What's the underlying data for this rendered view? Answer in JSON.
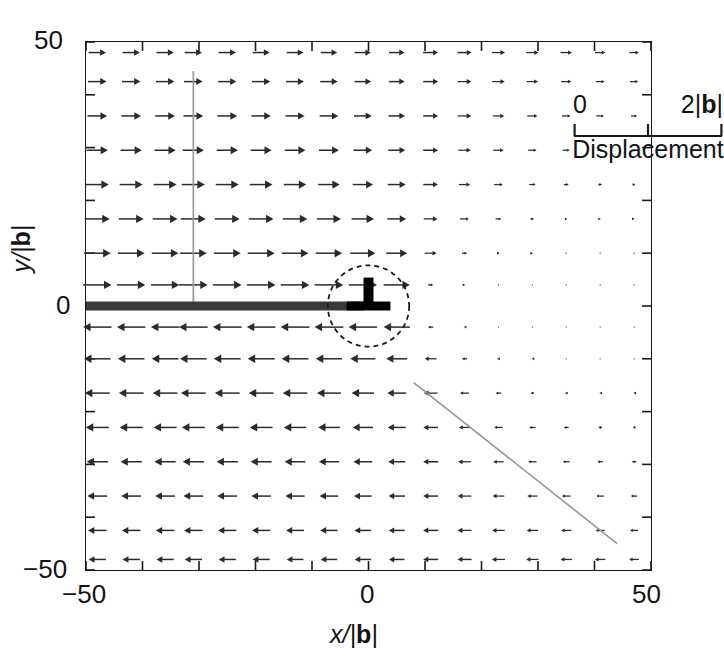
{
  "figure": {
    "kind": "vector-field-quiver"
  },
  "axes": {
    "x": {
      "title": "x/|b|",
      "title_var": "x",
      "title_sep": "/|",
      "title_vec": "b",
      "title_close": "|",
      "ticks": [
        -50,
        0,
        50
      ],
      "tick_labels": [
        "−50",
        "0",
        "50"
      ],
      "minor_tick_step": 10,
      "range": [
        -50,
        50
      ]
    },
    "y": {
      "title": "y/|b|",
      "title_var": "y",
      "title_sep": "/|",
      "title_vec": "b",
      "title_close": "|",
      "ticks": [
        50,
        0,
        -50
      ],
      "tick_labels": [
        "50",
        "0",
        "−50"
      ],
      "minor_tick_step": 10,
      "range": [
        -50,
        50
      ]
    },
    "frame_color": "#1a1a1a"
  },
  "legend": {
    "name": "displacement-scale-bar",
    "min_label": "0",
    "max_label_number": "2",
    "max_label_vector": "b",
    "max_label": "2|b|",
    "caption": "Displacement",
    "tick_count": 3,
    "bar_color": "#1a1a1a"
  },
  "annotations": {
    "dislocation_symbol": {
      "name": "edge-dislocation-symbol",
      "glyph": "⊥",
      "x": 0,
      "y": 0,
      "color": "#000000"
    },
    "core_circle": {
      "name": "dislocation-core-circle",
      "x": 0,
      "y": 0,
      "radius_units": 7.2,
      "style": "dashed",
      "color": "#1a1a1a"
    },
    "slip_plane": {
      "name": "slip-plane-line",
      "x_start": -50,
      "x_end": -0.8,
      "y": 0,
      "color": "#3a3a3a",
      "thickness_px": 9
    },
    "guide_vertical": {
      "name": "guide-line-vertical",
      "x": -31,
      "y_top": 44.5,
      "y_bottom": 0,
      "color": "#9a9a9a"
    },
    "guide_diagonal": {
      "name": "guide-line-diagonal",
      "x_start": 8,
      "y_start": -14.5,
      "x_end": 44,
      "y_end": -45,
      "color": "#9a9a9a"
    }
  },
  "chart_data": {
    "type": "scatter",
    "subtype": "quiver",
    "title": "",
    "xlabel": "x/|b|",
    "ylabel": "y/|b|",
    "xlim": [
      -50,
      50
    ],
    "ylim": [
      -50,
      50
    ],
    "grid": false,
    "legend_position": "top-right",
    "scale": {
      "arrow_full_length_units": 2,
      "arrow_full_length_label": "2|b|",
      "zero_label": "0"
    },
    "notes": [
      "Arrows above the slip plane (y>0) point in +x direction.",
      "Arrows below the slip plane (y<0) point in -x direction.",
      "Arrow magnitude decays with distance from the dislocation core at (0,0).",
      "On the x>0 side near y=0 the displacement magnitude collapses to nearly zero."
    ],
    "grid_x": [
      -48,
      -42,
      -36,
      -31,
      -25,
      -19,
      -13,
      -7,
      -1,
      5,
      11,
      17,
      23,
      29,
      35,
      41,
      47
    ],
    "grid_y": [
      48,
      42.5,
      36,
      29.5,
      23,
      16.5,
      10,
      4,
      -4,
      -10,
      -16.5,
      -23,
      -29.5,
      -36,
      -42.5,
      -48
    ],
    "series": [
      {
        "name": "displacement-field",
        "component": "ux",
        "color": "#2b2b2b",
        "rows": [
          {
            "y": 48,
            "values": [
              0.58,
              0.58,
              0.58,
              0.58,
              0.57,
              0.57,
              0.56,
              0.55,
              0.54,
              0.52,
              0.5,
              0.47,
              0.44,
              0.41,
              0.38,
              0.35,
              0.32
            ]
          },
          {
            "y": 42.5,
            "values": [
              0.62,
              0.62,
              0.62,
              0.62,
              0.61,
              0.61,
              0.6,
              0.58,
              0.56,
              0.53,
              0.5,
              0.46,
              0.42,
              0.38,
              0.34,
              0.3,
              0.27
            ]
          },
          {
            "y": 36,
            "values": [
              0.66,
              0.66,
              0.66,
              0.66,
              0.66,
              0.65,
              0.64,
              0.62,
              0.59,
              0.55,
              0.5,
              0.45,
              0.39,
              0.34,
              0.29,
              0.25,
              0.21
            ]
          },
          {
            "y": 29.5,
            "values": [
              0.71,
              0.71,
              0.71,
              0.71,
              0.71,
              0.7,
              0.69,
              0.67,
              0.63,
              0.57,
              0.5,
              0.42,
              0.35,
              0.28,
              0.23,
              0.18,
              0.15
            ]
          },
          {
            "y": 23,
            "values": [
              0.77,
              0.77,
              0.77,
              0.77,
              0.77,
              0.76,
              0.75,
              0.72,
              0.68,
              0.6,
              0.49,
              0.38,
              0.29,
              0.21,
              0.16,
              0.12,
              0.09
            ]
          },
          {
            "y": 16.5,
            "values": [
              0.83,
              0.83,
              0.83,
              0.83,
              0.83,
              0.83,
              0.82,
              0.8,
              0.75,
              0.63,
              0.46,
              0.3,
              0.19,
              0.12,
              0.08,
              0.05,
              0.04
            ]
          },
          {
            "y": 10,
            "values": [
              0.89,
              0.89,
              0.89,
              0.89,
              0.9,
              0.9,
              0.89,
              0.88,
              0.84,
              0.7,
              0.4,
              0.17,
              0.08,
              0.04,
              0.02,
              0.01,
              0.01
            ]
          },
          {
            "y": 4,
            "values": [
              0.95,
              0.95,
              0.95,
              0.96,
              0.96,
              0.96,
              0.96,
              0.96,
              0.95,
              0.88,
              0.18,
              0.05,
              0.02,
              0.01,
              0.01,
              0.0,
              0.0
            ]
          },
          {
            "y": -4,
            "values": [
              -0.95,
              -0.95,
              -0.95,
              -0.96,
              -0.96,
              -0.96,
              -0.96,
              -0.96,
              -0.95,
              -0.88,
              -0.18,
              -0.05,
              -0.02,
              -0.01,
              -0.01,
              0.0,
              0.0
            ]
          },
          {
            "y": -10,
            "values": [
              -0.89,
              -0.89,
              -0.89,
              -0.89,
              -0.9,
              -0.9,
              -0.89,
              -0.88,
              -0.84,
              -0.7,
              -0.4,
              -0.17,
              -0.08,
              -0.04,
              -0.02,
              -0.01,
              -0.01
            ]
          },
          {
            "y": -16.5,
            "values": [
              -0.83,
              -0.83,
              -0.83,
              -0.83,
              -0.83,
              -0.83,
              -0.82,
              -0.8,
              -0.75,
              -0.63,
              -0.46,
              -0.3,
              -0.19,
              -0.12,
              -0.08,
              -0.05,
              -0.04
            ]
          },
          {
            "y": -23,
            "values": [
              -0.77,
              -0.77,
              -0.77,
              -0.77,
              -0.77,
              -0.76,
              -0.75,
              -0.72,
              -0.68,
              -0.6,
              -0.49,
              -0.38,
              -0.29,
              -0.21,
              -0.16,
              -0.12,
              -0.09
            ]
          },
          {
            "y": -29.5,
            "values": [
              -0.71,
              -0.71,
              -0.71,
              -0.71,
              -0.71,
              -0.7,
              -0.69,
              -0.67,
              -0.63,
              -0.57,
              -0.5,
              -0.42,
              -0.35,
              -0.28,
              -0.23,
              -0.18,
              -0.15
            ]
          },
          {
            "y": -36,
            "values": [
              -0.66,
              -0.66,
              -0.66,
              -0.66,
              -0.66,
              -0.65,
              -0.64,
              -0.62,
              -0.59,
              -0.55,
              -0.5,
              -0.45,
              -0.39,
              -0.34,
              -0.29,
              -0.25,
              -0.21
            ]
          },
          {
            "y": -42.5,
            "values": [
              -0.62,
              -0.62,
              -0.62,
              -0.62,
              -0.61,
              -0.61,
              -0.6,
              -0.58,
              -0.56,
              -0.53,
              -0.5,
              -0.46,
              -0.42,
              -0.38,
              -0.34,
              -0.3,
              -0.27
            ]
          },
          {
            "y": -48,
            "values": [
              -0.58,
              -0.58,
              -0.58,
              -0.58,
              -0.57,
              -0.57,
              -0.56,
              -0.55,
              -0.54,
              -0.52,
              -0.5,
              -0.47,
              -0.44,
              -0.41,
              -0.38,
              -0.35,
              -0.32
            ]
          }
        ]
      }
    ]
  }
}
